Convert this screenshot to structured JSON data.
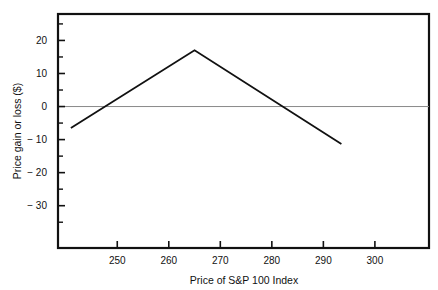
{
  "chart_data": {
    "type": "line",
    "title": "",
    "subtitle": "",
    "xlabel": "Price of S&P 100 Index",
    "ylabel": "Price gain or loss ($)",
    "xlim": [
      238.5,
      310.5
    ],
    "ylim": [
      -42.8,
      28.0
    ],
    "grid": false,
    "legend": null,
    "zero_line": 0,
    "xticks": [
      250,
      260,
      270,
      280,
      290,
      300
    ],
    "xtick_labels": [
      "250",
      "260",
      "270",
      "280",
      "290",
      "300"
    ],
    "yticks": [
      20,
      10,
      0,
      -10,
      -20,
      -30
    ],
    "ytick_labels": [
      "20",
      "10",
      "0",
      "− 10",
      "− 20",
      "− 30"
    ],
    "yminor_ticks": [
      25,
      15,
      5,
      -5,
      -15,
      -25,
      -35
    ],
    "series": [
      {
        "name": "Price gain or loss",
        "x": [
          241.0,
          265.0,
          293.5
        ],
        "y": [
          -6.5,
          17.0,
          -11.3
        ],
        "color": "#111111",
        "linewidth": 1.8
      }
    ],
    "annotations": [
      {
        "text": "peak at index 265, gain $17",
        "x": 265,
        "y": 17
      },
      {
        "text": "breakeven near index 248",
        "x": 248,
        "y": 0
      },
      {
        "text": "breakeven near index 282",
        "x": 282,
        "y": 0
      }
    ]
  },
  "axes": {
    "x_axis_title": "Price of S&P 100 Index",
    "y_axis_title": "Price gain or loss ($)"
  },
  "colors": {
    "line": "#111111",
    "frame": "#111111",
    "zero_line": "#8a8a8a",
    "background": "#ffffff",
    "text": "#111111"
  }
}
